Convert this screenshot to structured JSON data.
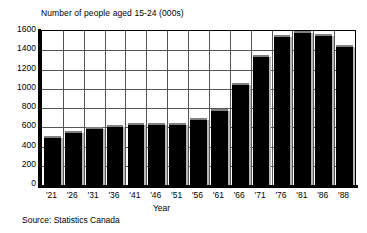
{
  "chart_data": {
    "type": "bar",
    "title": "Number of people aged 15-24 (000s)",
    "xlabel": "Year",
    "ylabel": "",
    "ylim": [
      0,
      1600
    ],
    "ytick_step": 200,
    "yticks": [
      1600,
      1400,
      1200,
      1000,
      800,
      600,
      400,
      200,
      0
    ],
    "ytick_labels": [
      "1600",
      "1400",
      "1200",
      "1000",
      "800",
      "600",
      "400",
      "200",
      "0"
    ],
    "categories": [
      "'21",
      "'26",
      "'31",
      "'36",
      "'41",
      "'46",
      "'51",
      "'56",
      "'61",
      "'66",
      "'71",
      "'76",
      "'81",
      "'86",
      "'88"
    ],
    "values": [
      505,
      560,
      605,
      620,
      645,
      640,
      640,
      700,
      790,
      1065,
      1350,
      1555,
      1610,
      1570,
      1455
    ],
    "grid": true,
    "legend": null,
    "bar_color": "#000000",
    "bar_shadow_color": "#b8b8b8",
    "grid_color": "#555555",
    "axis_color": "#000000",
    "background": "#ffffff"
  },
  "source": {
    "text": "Source: Statistics Canada"
  }
}
